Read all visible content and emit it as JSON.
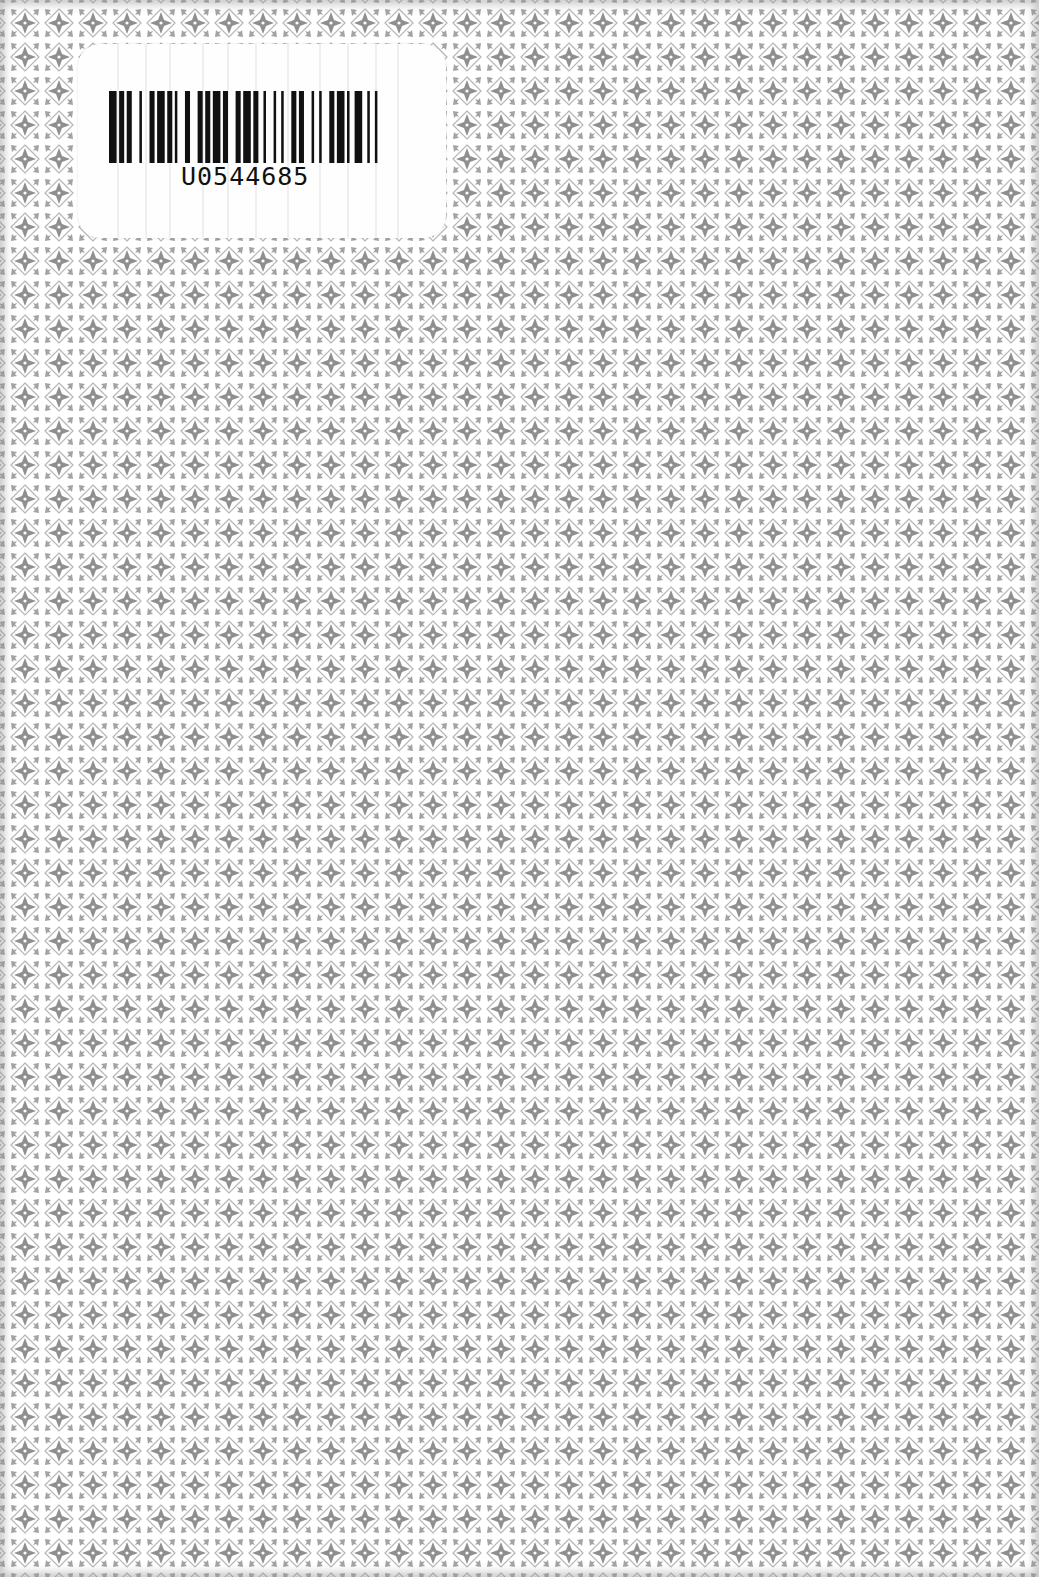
{
  "page": {
    "type": "book back cover scan",
    "background_color": "#f4f4f4",
    "pattern": {
      "motif": "ornamental quatrefoil tile",
      "tile_pitch_px": 34,
      "tile_color": "#9a9a9a",
      "grid_line_color": "#ffffff"
    }
  },
  "barcode_label": {
    "code": "U0544685",
    "bar_color": "#111111",
    "label_color": "#fefefe",
    "bars": [
      3,
      1,
      2,
      1,
      2,
      3,
      1,
      3,
      2,
      1,
      3,
      1,
      2,
      1,
      1,
      3,
      2,
      3,
      2,
      1,
      2,
      1,
      3,
      1,
      2,
      3,
      2,
      1,
      3,
      1,
      2,
      2,
      1,
      3,
      1,
      2,
      1,
      3,
      2,
      1,
      2,
      3,
      1,
      2,
      1,
      3,
      2,
      1,
      3,
      1,
      1,
      2,
      3,
      2,
      1,
      2,
      1,
      3
    ]
  }
}
